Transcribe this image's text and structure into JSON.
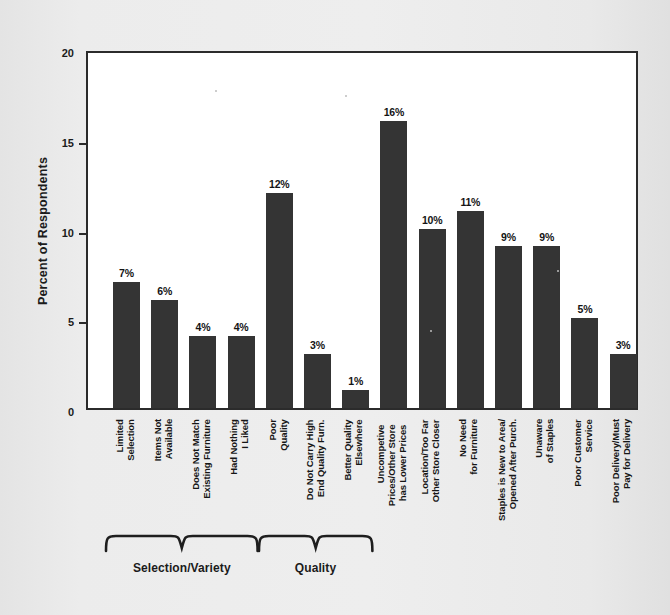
{
  "chart_data": {
    "type": "bar",
    "title": "",
    "xlabel": "",
    "ylabel": "Percent of Respondents",
    "ylim": [
      0,
      20
    ],
    "yticks": [
      0,
      5,
      10,
      15,
      20
    ],
    "ytick_labels": [
      "0",
      "5",
      "10",
      "15",
      "20"
    ],
    "grid": false,
    "legend": null,
    "value_suffix": "%",
    "categories": [
      "Limited Selection",
      "Items Not Available",
      "Does Not Match Existing Furniture",
      "Had Nothing I Liked",
      "Poor Quality",
      "Do Not Carry High End Quality Furn.",
      "Better Quality Elsewhere",
      "Uncompetive Prices/Other Store has Lower Prices",
      "Location/Too Far Other Store Closer",
      "No Need for Furniture",
      "Staples is New to Area/ Opened After Purch.",
      "Unaware of Staples",
      "Poor Customer Service",
      "Poor Delivery/Must Pay for Delivery"
    ],
    "category_lines": [
      [
        "Limited",
        "Selection"
      ],
      [
        "Items Not",
        "Available"
      ],
      [
        "Does Not Match",
        "Existing Furniture"
      ],
      [
        "Had Nothing",
        "I Liked"
      ],
      [
        "Poor",
        "Quality"
      ],
      [
        "Do Not Carry High",
        "End Quality Furn."
      ],
      [
        "Better Quality",
        "Elsewhere"
      ],
      [
        "Uncompetive",
        "Prices/Other Store",
        "has Lower Prices"
      ],
      [
        "Location/Too Far",
        "Other Store Closer"
      ],
      [
        "No Need",
        "for Furniture"
      ],
      [
        "Staples is New to Area/",
        "Opened After Purch."
      ],
      [
        "Unaware",
        "of Staples"
      ],
      [
        "Poor Customer",
        "Service"
      ],
      [
        "Poor Delivery/Must",
        "Pay for Delivery"
      ]
    ],
    "values": [
      7,
      6,
      4,
      4,
      12,
      3,
      1,
      16,
      10,
      11,
      9,
      9,
      5,
      3
    ],
    "value_labels": [
      "7%",
      "6%",
      "4%",
      "4%",
      "12%",
      "3%",
      "1%",
      "16%",
      "10%",
      "11%",
      "9%",
      "9%",
      "5%",
      "3%"
    ],
    "groups": [
      {
        "label": "Selection/Variety",
        "first_bar": 0,
        "last_bar": 3
      },
      {
        "label": "Quality",
        "first_bar": 4,
        "last_bar": 6
      }
    ],
    "colors": {
      "bar": "#343434",
      "axis": "#2b2b2b",
      "plot_background": "#ffffff",
      "page_background": "#eaeaea",
      "text": "#161616"
    }
  }
}
